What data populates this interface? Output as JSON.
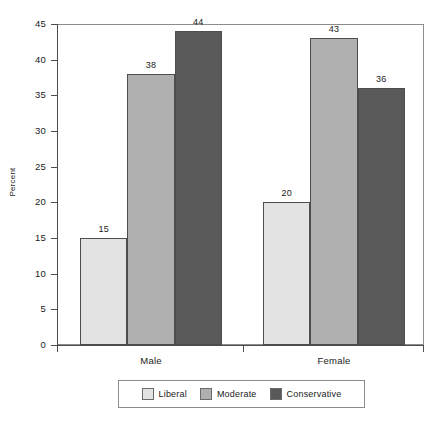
{
  "chart_data": {
    "type": "bar",
    "title": "",
    "subtitle": "",
    "xlabel": "",
    "ylabel": "Percent",
    "categories": [
      "Male",
      "Female"
    ],
    "series": [
      {
        "name": "Liberal",
        "values": [
          15,
          38
        ],
        "color": "#e3e3e3"
      },
      {
        "name": "Moderate",
        "values": [
          38,
          43
        ],
        "color": "#b0b0b0"
      },
      {
        "name": "Conservative",
        "values": [
          44,
          36
        ],
        "color": "#595959"
      }
    ],
    "series_fixed": [
      {
        "name": "Liberal",
        "values": [
          15,
          20
        ],
        "color": "#e3e3e3"
      },
      {
        "name": "Moderate",
        "values": [
          38,
          43
        ],
        "color": "#b0b0b0"
      },
      {
        "name": "Conservative",
        "values": [
          44,
          36
        ],
        "color": "#595959"
      }
    ],
    "bars": [
      {
        "group": "Male",
        "series": "Liberal",
        "value": 15,
        "label": "15",
        "color": "#e3e3e3"
      },
      {
        "group": "Male",
        "series": "Moderate",
        "value": 38,
        "label": "38",
        "color": "#b0b0b0"
      },
      {
        "group": "Male",
        "series": "Conservative",
        "value": 44,
        "label": "44",
        "color": "#595959"
      },
      {
        "group": "Female",
        "series": "Liberal",
        "value": 20,
        "label": "20",
        "color": "#e3e3e3"
      },
      {
        "group": "Female",
        "series": "Moderate",
        "value": 43,
        "label": "43",
        "color": "#b0b0b0"
      },
      {
        "group": "Female",
        "series": "Conservative",
        "value": 36,
        "label": "36",
        "color": "#595959"
      }
    ],
    "ylim": [
      0,
      45
    ],
    "ytick_step": 5,
    "yticks": [
      0,
      5,
      10,
      15,
      20,
      25,
      30,
      35,
      40,
      45
    ],
    "ytick_labels": [
      "0",
      "5",
      "10",
      "15",
      "20",
      "25",
      "30",
      "35",
      "40",
      "45"
    ],
    "grid": false,
    "legend_position": "bottom",
    "data_labels": true
  },
  "axes": {
    "y_title": "Percent",
    "tick_labels": [
      "45",
      "40",
      "35",
      "30",
      "25",
      "20",
      "15",
      "10",
      "5",
      "0"
    ],
    "group_labels": [
      "Male",
      "Female"
    ]
  },
  "legend": {
    "items": [
      {
        "label": "Liberal",
        "color": "#e3e3e3"
      },
      {
        "label": "Moderate",
        "color": "#b0b0b0"
      },
      {
        "label": "Conservative",
        "color": "#595959"
      }
    ]
  },
  "bar_labels": {
    "male_liberal": "15",
    "male_moderate": "38",
    "male_conservative": "44",
    "female_liberal": "20",
    "female_moderate": "43",
    "female_conservative": "36"
  }
}
